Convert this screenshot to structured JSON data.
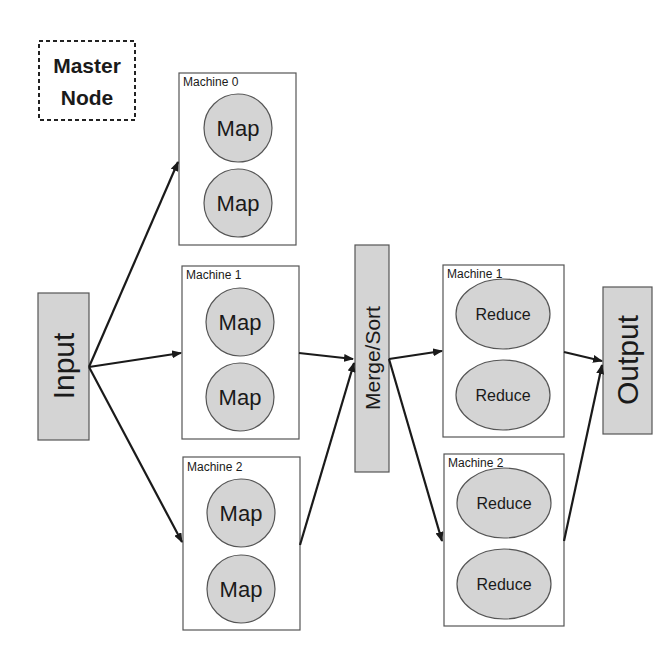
{
  "master_node": {
    "line1": "Master",
    "line2": "Node"
  },
  "input": {
    "label": "Input"
  },
  "merge_sort": {
    "label": "Merge/Sort"
  },
  "output": {
    "label": "Output"
  },
  "map_machines": [
    {
      "label": "Machine 0",
      "tasks": [
        "Map",
        "Map"
      ]
    },
    {
      "label": "Machine 1",
      "tasks": [
        "Map",
        "Map"
      ]
    },
    {
      "label": "Machine 2",
      "tasks": [
        "Map",
        "Map"
      ]
    }
  ],
  "reduce_machines": [
    {
      "label": "Machine 1",
      "tasks": [
        "Reduce",
        "Reduce"
      ]
    },
    {
      "label": "Machine 2",
      "tasks": [
        "Reduce",
        "Reduce"
      ]
    }
  ],
  "colors": {
    "node_fill": "#d4d4d4",
    "stroke": "#333333",
    "box_stroke": "#555555"
  }
}
